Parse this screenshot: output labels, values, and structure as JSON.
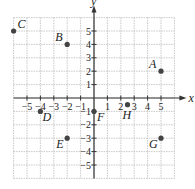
{
  "axes": {
    "x_label": "x",
    "y_label": "y",
    "range": [
      -6,
      6
    ]
  },
  "x_ticks": [
    {
      "v": -5,
      "t": "−5"
    },
    {
      "v": -4,
      "t": "−4"
    },
    {
      "v": -3,
      "t": "−3"
    },
    {
      "v": -2,
      "t": "−2"
    },
    {
      "v": -1,
      "t": "−1"
    },
    {
      "v": 1,
      "t": "1"
    },
    {
      "v": 2,
      "t": "2"
    },
    {
      "v": 3,
      "t": "3"
    },
    {
      "v": 4,
      "t": "4"
    },
    {
      "v": 5,
      "t": "5"
    }
  ],
  "y_ticks": [
    {
      "v": 5,
      "t": "5"
    },
    {
      "v": 4,
      "t": "4"
    },
    {
      "v": 3,
      "t": "3"
    },
    {
      "v": 2,
      "t": "2"
    },
    {
      "v": 1,
      "t": "1"
    },
    {
      "v": -1,
      "t": "−1"
    },
    {
      "v": -2,
      "t": "−2"
    },
    {
      "v": -3,
      "t": "−3"
    },
    {
      "v": -4,
      "t": "−4"
    },
    {
      "v": -5,
      "t": "−5"
    }
  ],
  "points": [
    {
      "name": "A",
      "x": 5,
      "y": 2,
      "lx": -12,
      "ly": -3
    },
    {
      "name": "B",
      "x": -2,
      "y": 4,
      "lx": -12,
      "ly": -3
    },
    {
      "name": "C",
      "x": -6,
      "y": 5,
      "lx": 4,
      "ly": -3
    },
    {
      "name": "D",
      "x": -4,
      "y": -1,
      "lx": 2,
      "ly": 10
    },
    {
      "name": "E",
      "x": -2,
      "y": -3,
      "lx": -11,
      "ly": 10
    },
    {
      "name": "F",
      "x": 0,
      "y": -1,
      "lx": 3,
      "ly": 10
    },
    {
      "name": "G",
      "x": 5,
      "y": -3,
      "lx": -12,
      "ly": 10
    },
    {
      "name": "H",
      "x": 2.5,
      "y": -0.5,
      "lx": -5,
      "ly": 14
    }
  ],
  "colors": {
    "grid": "#bbbbbb",
    "axis": "#333333",
    "point": "#444444"
  }
}
